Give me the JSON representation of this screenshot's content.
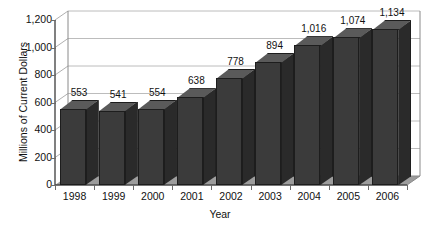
{
  "chart_data": {
    "type": "bar",
    "title": "",
    "xlabel": "Year",
    "ylabel": "Millions of Current Dollars",
    "categories": [
      "1998",
      "1999",
      "2000",
      "2001",
      "2002",
      "2003",
      "2004",
      "2005",
      "2006"
    ],
    "values": [
      553,
      541,
      554,
      638,
      778,
      894,
      1016,
      1074,
      1134
    ],
    "value_labels": [
      "553",
      "541",
      "554",
      "638",
      "778",
      "894",
      "1,016",
      "1,074",
      "1,134"
    ],
    "ylim": [
      0,
      1200
    ],
    "ytick_values": [
      0,
      200,
      400,
      600,
      800,
      1000,
      1200
    ],
    "ytick_labels": [
      "0",
      "200",
      "400",
      "600",
      "800",
      "1,000",
      "1,200"
    ],
    "grid": true,
    "grid_axis": "y",
    "legend": false,
    "legend_position": "none",
    "style": "3d-column",
    "colors": {
      "bar_front": "#3b3b3b",
      "bar_top": "#5a5a5a",
      "bar_side": "#2a2a2a",
      "bar_outline": "#1d1d1d",
      "gridline": "#b8b8b8",
      "axis": "#4a4a4a",
      "floor": "#9a9a9a",
      "wall": "#ffffff",
      "text": "#111111",
      "background": "#ffffff"
    }
  }
}
